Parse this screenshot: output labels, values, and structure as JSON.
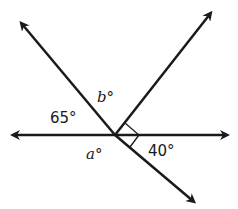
{
  "diagram": {
    "type": "intersecting-lines-angles",
    "intersection": [
      115,
      135
    ],
    "line_color": "#1a1a1a",
    "labels": {
      "angle_65": "65°",
      "angle_b": "b°",
      "angle_a": "a°",
      "angle_40": "40°"
    },
    "right_angle_marker": true
  }
}
